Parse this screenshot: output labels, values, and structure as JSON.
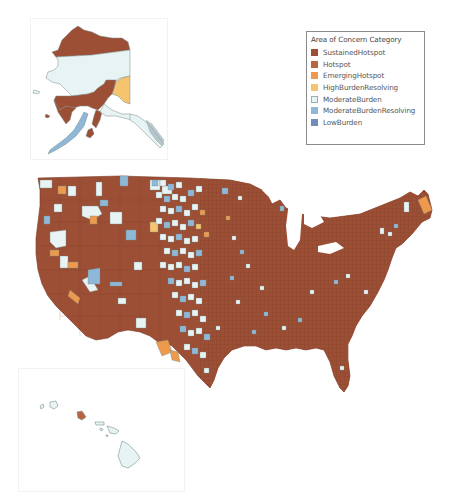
{
  "legend": {
    "title": "Area of Concern Category",
    "items": [
      {
        "label": "SustainedHotspot",
        "color": "#9c4f35"
      },
      {
        "label": "Hotspot",
        "color": "#b8643f"
      },
      {
        "label": "EmergingHotspot",
        "color": "#ee9a4c"
      },
      {
        "label": "HighBurdenResolving",
        "color": "#f6c46e"
      },
      {
        "label": "ModerateBurden",
        "color": "#e8f4f4"
      },
      {
        "label": "ModerateBurdenResolving",
        "color": "#8fb8d8"
      },
      {
        "label": "LowBurden",
        "color": "#6f8fba"
      }
    ]
  },
  "map": {
    "regions": [
      "Alaska inset",
      "Continental US",
      "Hawaii inset"
    ],
    "dominant_category": "SustainedHotspot"
  }
}
